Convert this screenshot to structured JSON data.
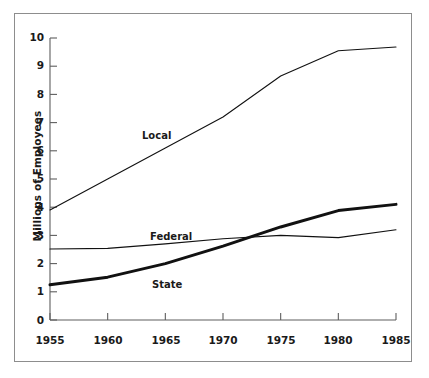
{
  "chart_data": {
    "type": "line",
    "title": "",
    "subtitle": "",
    "xlabel": "",
    "ylabel": "Millions of Employees",
    "x": [
      1955,
      1960,
      1965,
      1970,
      1975,
      1980,
      1985
    ],
    "xtick_labels": [
      "1955",
      "1960",
      "1965",
      "1970",
      "1975",
      "1980",
      "1985"
    ],
    "ytick_labels": [
      "0",
      "1",
      "2",
      "3",
      "4",
      "5",
      "6",
      "7",
      "8",
      "9",
      "10"
    ],
    "yticks": [
      0,
      1,
      2,
      3,
      4,
      5,
      6,
      7,
      8,
      9,
      10
    ],
    "xlim": [
      1955,
      1985
    ],
    "ylim": [
      0,
      10
    ],
    "grid": false,
    "legend_position": "inline-annotations",
    "series": [
      {
        "name": "Local",
        "label": "Local",
        "color": "#111111",
        "line_width": 1.1,
        "values": [
          3.9,
          5.0,
          6.1,
          7.2,
          8.65,
          9.55,
          9.68
        ]
      },
      {
        "name": "Federal",
        "label": "Federal",
        "color": "#111111",
        "line_width": 1.1,
        "values": [
          2.52,
          2.54,
          2.7,
          2.88,
          3.0,
          2.92,
          3.2
        ]
      },
      {
        "name": "State",
        "label": "State",
        "color": "#111111",
        "line_width": 3.0,
        "values": [
          1.25,
          1.52,
          2.0,
          2.62,
          3.3,
          3.88,
          4.1
        ]
      }
    ],
    "annotations": [
      {
        "text": "Local",
        "x": 1962.3,
        "y": 5.9
      },
      {
        "text": "Federal",
        "x": 1963.5,
        "y": 2.95
      },
      {
        "text": "State",
        "x": 1964.0,
        "y": 1.25
      }
    ]
  },
  "axes": {
    "y_title": "Millions of Employees"
  }
}
